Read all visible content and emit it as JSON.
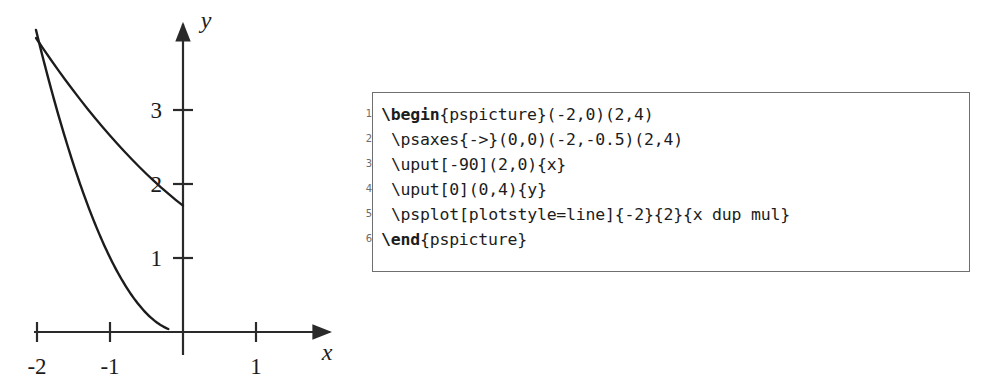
{
  "figure": {
    "name": "parabola-plot",
    "axis_labels": {
      "x": "x",
      "y": "y"
    },
    "x_ticks": [
      {
        "value": -2,
        "label": "-2"
      },
      {
        "value": -1,
        "label": "-1"
      },
      {
        "value": 1,
        "label": "1"
      }
    ],
    "y_ticks": [
      {
        "value": 1,
        "label": "1"
      },
      {
        "value": 2,
        "label": "2"
      },
      {
        "value": 3,
        "label": "3"
      }
    ],
    "curve_color": "#1c1c1c",
    "axis_color": "#2a2a2a"
  },
  "chart_data": {
    "type": "line",
    "title": "",
    "xlabel": "x",
    "ylabel": "y",
    "xlim": [
      -2.2,
      2.3
    ],
    "ylim": [
      -0.5,
      4.3
    ],
    "xticks": [
      -2,
      -1,
      1
    ],
    "xticklabels": [
      "-2",
      "-1",
      "1"
    ],
    "yticks": [
      1,
      2,
      3
    ],
    "yticklabels": [
      "1",
      "2",
      "3"
    ],
    "grid": false,
    "legend": null,
    "series": [
      {
        "name": "x dup mul",
        "expression": "y = x^2",
        "x": [
          -2,
          -1.8,
          -1.6,
          -1.4,
          -1.2,
          -1,
          -0.8,
          -0.6,
          -0.4,
          -0.2,
          0,
          0.2,
          0.4,
          0.6,
          0.8,
          1,
          1.2,
          1.4,
          1.6,
          1.8,
          2
        ],
        "values": [
          4,
          3.24,
          2.56,
          1.96,
          1.44,
          1,
          0.64,
          0.36,
          0.16,
          0.04,
          0,
          0.04,
          0.16,
          0.36,
          0.64,
          1,
          1.44,
          1.96,
          2.56,
          3.24,
          4
        ]
      }
    ]
  },
  "code": {
    "language": "latex",
    "line_numbers": [
      "1",
      "2",
      "3",
      "4",
      "5",
      "6"
    ],
    "lines": [
      {
        "number": "1",
        "bold": "\\begin",
        "rest": "{pspicture}(-2,0)(2,4)",
        "indent": 0
      },
      {
        "number": "2",
        "bold": "",
        "rest": "\\psaxes{->}(0,0)(-2,-0.5)(2,4)",
        "indent": 1
      },
      {
        "number": "3",
        "bold": "",
        "rest": "\\uput[-90](2,0){x}",
        "indent": 1
      },
      {
        "number": "4",
        "bold": "",
        "rest": "\\uput[0](0,4){y}",
        "indent": 1
      },
      {
        "number": "5",
        "bold": "",
        "rest": "\\psplot[plotstyle=line]{-2}{2}{x dup mul}",
        "indent": 1
      },
      {
        "number": "6",
        "bold": "\\end",
        "rest": "{pspicture}",
        "indent": 0
      }
    ]
  }
}
